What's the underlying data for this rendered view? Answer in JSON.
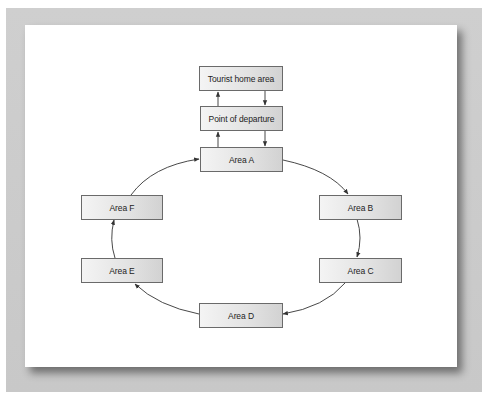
{
  "diagram": {
    "type": "flow-cycle",
    "nodes": [
      {
        "id": "home",
        "label": "Tourist home area"
      },
      {
        "id": "departure",
        "label": "Point of departure"
      },
      {
        "id": "a",
        "label": "Area A"
      },
      {
        "id": "b",
        "label": "Area B"
      },
      {
        "id": "c",
        "label": "Area C"
      },
      {
        "id": "d",
        "label": "Area D"
      },
      {
        "id": "e",
        "label": "Area E"
      },
      {
        "id": "f",
        "label": "Area F"
      }
    ],
    "edges": [
      {
        "from": "home",
        "to": "departure"
      },
      {
        "from": "departure",
        "to": "home"
      },
      {
        "from": "departure",
        "to": "a"
      },
      {
        "from": "a",
        "to": "departure"
      },
      {
        "from": "a",
        "to": "b"
      },
      {
        "from": "b",
        "to": "c"
      },
      {
        "from": "c",
        "to": "d"
      },
      {
        "from": "d",
        "to": "e"
      },
      {
        "from": "e",
        "to": "f"
      },
      {
        "from": "f",
        "to": "a"
      }
    ],
    "colors": {
      "frame": "#cccccc",
      "panel": "#ffffff",
      "node_border": "#6a6a6a",
      "node_fill_light": "#f4f4f4",
      "node_fill_dark": "#d2d2d2",
      "line": "#333333"
    }
  }
}
